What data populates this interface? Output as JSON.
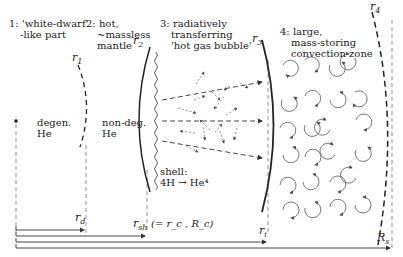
{
  "zones": [
    {
      "number": "1:",
      "lines": [
        "'white-dwarf'",
        "-like part"
      ]
    },
    {
      "number": "2:",
      "lines": [
        "hot,",
        "~massless",
        "mantle"
      ]
    },
    {
      "number": "3:",
      "lines": [
        "radiatively",
        "transferring",
        "'hot gas bubble'"
      ]
    },
    {
      "number": "4:",
      "lines": [
        "large,",
        "mass-storing",
        "convection zone"
      ]
    }
  ],
  "region_labels": {
    "degen_1": "degen.",
    "degen_2": "He",
    "nondeg_1": "non-deg.",
    "nondeg_2": "He",
    "shell_1": "shell:",
    "shell_2": "4H → He⁴"
  },
  "radii": {
    "r1": {
      "base": "r",
      "sub": "1"
    },
    "r2": {
      "base": "r",
      "sub": "2"
    },
    "r3": {
      "base": "r",
      "sub": "3"
    },
    "r4": {
      "base": "r",
      "sub": "4"
    },
    "rd": {
      "base": "r",
      "sub": "d"
    },
    "rsh": {
      "base": "r",
      "sub": "sh",
      "note": "(= r_c , R_c)"
    },
    "ri": {
      "base": "r",
      "sub": "i"
    },
    "Rs": {
      "base": "R",
      "sub": "s"
    }
  },
  "colors": {
    "ink": "#222222",
    "dashed": "#555555",
    "arrow": "#666666"
  }
}
